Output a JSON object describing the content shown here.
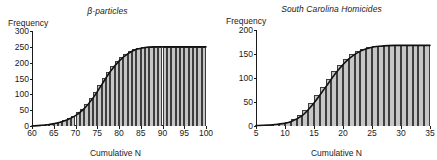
{
  "figure": {
    "panels": [
      {
        "id": "beta-particles",
        "title": "β-particles",
        "ylabel": "Frequency",
        "xlabel": "Cumulative N"
      },
      {
        "id": "south-carolina-homicides",
        "title": "South Carolina Homicides",
        "ylabel": "Frequency",
        "xlabel": "Cumulative N"
      }
    ]
  },
  "chart_data": [
    {
      "type": "bar",
      "id": "beta-particles",
      "title": "β-particles",
      "xlabel": "Cumulative N",
      "ylabel": "Frequency",
      "xlim": [
        60,
        100
      ],
      "ylim": [
        0,
        300
      ],
      "xticks": [
        60,
        65,
        70,
        75,
        80,
        85,
        90,
        95,
        100
      ],
      "yticks": [
        0,
        50,
        100,
        150,
        200,
        250,
        300
      ],
      "grid": false,
      "legend": false,
      "annotation": "Cumulative frequency (ogive) bars with overlaid smooth S-curve",
      "series": [
        {
          "name": "Cumulative frequency (bars)",
          "x": [
            61,
            62,
            63,
            64,
            65,
            66,
            67,
            68,
            69,
            70,
            71,
            72,
            73,
            74,
            75,
            76,
            77,
            78,
            79,
            80,
            81,
            82,
            83,
            84,
            85,
            86,
            87,
            88,
            89,
            90,
            91,
            92,
            93,
            94,
            95,
            96,
            97,
            98,
            99,
            100
          ],
          "values": [
            1,
            2,
            3,
            5,
            7,
            10,
            14,
            19,
            25,
            33,
            43,
            55,
            70,
            88,
            108,
            130,
            152,
            172,
            190,
            205,
            218,
            228,
            236,
            242,
            246,
            248,
            249,
            250,
            250,
            250,
            250,
            250,
            250,
            250,
            250,
            250,
            250,
            250,
            250,
            250
          ]
        },
        {
          "name": "Fitted cumulative curve",
          "x": [
            60,
            62,
            64,
            66,
            68,
            70,
            72,
            74,
            76,
            78,
            80,
            82,
            84,
            86,
            88,
            90,
            92,
            94,
            96,
            98,
            100
          ],
          "values": [
            0,
            2,
            5,
            10,
            19,
            33,
            55,
            88,
            130,
            172,
            205,
            228,
            242,
            248,
            250,
            250,
            250,
            250,
            250,
            250,
            250
          ]
        }
      ]
    },
    {
      "type": "bar",
      "id": "south-carolina-homicides",
      "title": "South Carolina Homicides",
      "xlabel": "Cumulative N",
      "ylabel": "Frequency",
      "xlim": [
        5,
        35
      ],
      "ylim": [
        0,
        200
      ],
      "xticks": [
        5,
        10,
        15,
        20,
        25,
        30,
        35
      ],
      "yticks": [
        0,
        50,
        100,
        150,
        200
      ],
      "grid": false,
      "legend": false,
      "annotation": "Cumulative frequency (ogive) bars with overlaid smooth S-curve",
      "series": [
        {
          "name": "Cumulative frequency (bars)",
          "x": [
            6,
            7,
            8,
            9,
            10,
            11,
            12,
            13,
            14,
            15,
            16,
            17,
            18,
            19,
            20,
            21,
            22,
            23,
            24,
            25,
            26,
            27,
            28,
            29,
            30,
            31,
            32,
            33,
            34,
            35
          ],
          "values": [
            2,
            2,
            3,
            4,
            6,
            9,
            14,
            22,
            33,
            48,
            64,
            81,
            98,
            114,
            128,
            140,
            149,
            156,
            161,
            164,
            166,
            167,
            168,
            168,
            168,
            168,
            168,
            168,
            168,
            168
          ]
        },
        {
          "name": "Fitted cumulative curve",
          "x": [
            5,
            7,
            9,
            11,
            13,
            15,
            17,
            19,
            21,
            23,
            25,
            27,
            29,
            31,
            33,
            35
          ],
          "values": [
            1,
            2,
            4,
            9,
            22,
            48,
            81,
            114,
            140,
            156,
            164,
            167,
            168,
            168,
            168,
            168
          ]
        }
      ]
    }
  ]
}
